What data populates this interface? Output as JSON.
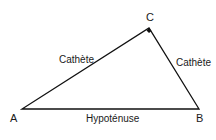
{
  "diagram": {
    "type": "right-triangle",
    "vertices": {
      "A": {
        "label": "A",
        "x": 22,
        "y": 109
      },
      "B": {
        "label": "B",
        "x": 199,
        "y": 109
      },
      "C": {
        "label": "C",
        "x": 149,
        "y": 28
      }
    },
    "right_angle_at": "C",
    "sides": {
      "AC": {
        "label": "Cathète"
      },
      "CB": {
        "label": "Cathète"
      },
      "AB": {
        "label": "Hypoténuse"
      }
    },
    "colors": {
      "line": "#111111",
      "text": "#1a1a1a",
      "background": "#ffffff"
    }
  }
}
